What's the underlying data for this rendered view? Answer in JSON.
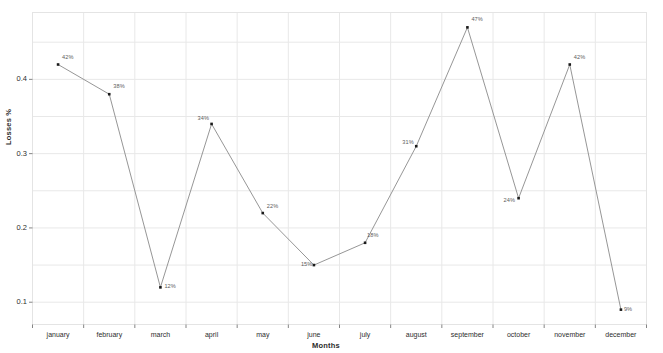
{
  "chart_data": {
    "type": "line",
    "title": "",
    "xlabel": "Months",
    "ylabel": "Losses %",
    "categories": [
      "january",
      "february",
      "march",
      "april",
      "may",
      "june",
      "july",
      "august",
      "september",
      "october",
      "november",
      "december"
    ],
    "values": [
      0.42,
      0.38,
      0.12,
      0.34,
      0.22,
      0.15,
      0.18,
      0.31,
      0.47,
      0.24,
      0.42,
      0.09
    ],
    "point_labels": [
      "42%",
      "38%",
      "12%",
      "34%",
      "22%",
      "15%",
      "18%",
      "31%",
      "47%",
      "24%",
      "42%",
      "9%"
    ],
    "ylim": [
      0.07,
      0.49
    ],
    "yticks": [
      "0.1",
      "0.2",
      "0.3",
      "0.4"
    ],
    "ytick_values": [
      0.1,
      0.2,
      0.3,
      0.4
    ],
    "grid": true,
    "legend": null,
    "marker": "dot",
    "line_color": "#8a8a8a",
    "marker_color": "#1a1a1a",
    "grid_color": "#e8e8e8",
    "background": "#ffffff"
  }
}
